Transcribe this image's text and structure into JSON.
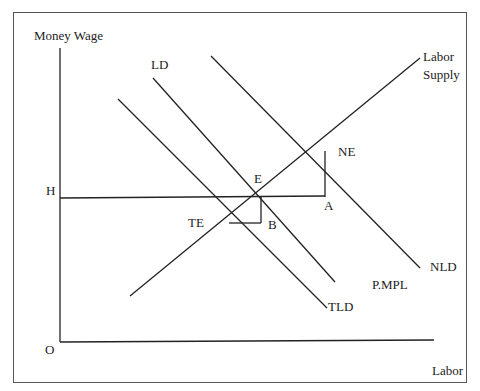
{
  "figure": {
    "y_axis_label": "Money Wage",
    "x_axis_label": "Labor",
    "origin_label": "O",
    "wage_level_label": "H",
    "curves": {
      "labor_supply": [
        "Labor",
        "Supply"
      ],
      "labor_demand": "LD",
      "new_labor_demand": "NLD",
      "total_labor_demand": "TLD",
      "price_mpl": "P.MPL"
    },
    "points": {
      "equilibrium": "E",
      "new_equilibrium": "NE",
      "temp_equilibrium": "TE",
      "point_a": "A",
      "point_b": "B"
    }
  }
}
